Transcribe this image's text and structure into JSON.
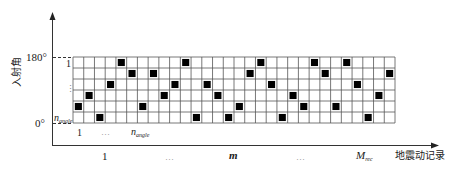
{
  "diagram": {
    "y_axis": {
      "title": "入射角",
      "top_label": "180°",
      "bottom_label": "0°"
    },
    "x_axis": {
      "title": "地震动记录",
      "ticks": [
        {
          "label": "1",
          "italic": false
        },
        {
          "label": "…",
          "italic": false
        },
        {
          "label": "m",
          "italic": true
        },
        {
          "label": "…",
          "italic": false
        },
        {
          "label": "M",
          "sub": "rec",
          "italic": true
        }
      ]
    },
    "grid": {
      "rows": 6,
      "cols": 30,
      "row_labels": {
        "top": "1",
        "middle": "⋮",
        "bottom_main": "n",
        "bottom_sub": "angle"
      },
      "col_labels": {
        "first": "1",
        "middle": "…",
        "last_main": "n",
        "last_sub": "angle"
      },
      "filled_row_per_col": [
        4,
        3,
        5,
        2,
        0,
        1,
        4,
        1,
        3,
        2,
        0,
        5,
        2,
        3,
        5,
        4,
        1,
        0,
        2,
        5,
        3,
        4,
        0,
        1,
        4,
        0,
        2,
        5,
        3,
        1
      ],
      "line_color": "#555555",
      "fill_color": "#000000"
    }
  }
}
